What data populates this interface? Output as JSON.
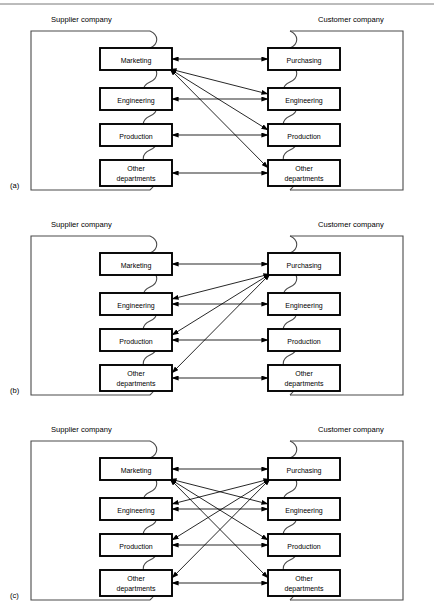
{
  "figure": {
    "top_rule": true,
    "background_color": "#ffffff",
    "box_border_color": "#000000",
    "frame_border_color": "#4a4a4a",
    "arrow_color": "#000000"
  },
  "headers": {
    "supplier": "Supplier company",
    "customer": "Customer company"
  },
  "supplier_departments": [
    {
      "label": "Marketing",
      "lines": [
        "Marketing"
      ]
    },
    {
      "label": "Engineering",
      "lines": [
        "Engineering"
      ]
    },
    {
      "label": "Production",
      "lines": [
        "Production"
      ]
    },
    {
      "label": "Other departments",
      "lines": [
        "Other",
        "departments"
      ]
    }
  ],
  "customer_departments": [
    {
      "label": "Purchasing",
      "lines": [
        "Purchasing"
      ]
    },
    {
      "label": "Engineering",
      "lines": [
        "Engineering"
      ]
    },
    {
      "label": "Production",
      "lines": [
        "Production"
      ]
    },
    {
      "label": "Other departments",
      "lines": [
        "Other",
        "departments"
      ]
    }
  ],
  "panels": [
    {
      "id": "a",
      "label": "(a)",
      "description": "All customer departments communicate through supplier Marketing",
      "horizontal_links": [
        {
          "from": "Marketing",
          "to": "Purchasing",
          "double_headed": true
        },
        {
          "from": "Engineering",
          "to": "Engineering",
          "double_headed": true
        },
        {
          "from": "Production",
          "to": "Production",
          "double_headed": true
        },
        {
          "from": "Other departments",
          "to": "Other departments",
          "double_headed": true
        }
      ],
      "fan_links": [
        {
          "hub": "supplier.Marketing",
          "spoke": "customer.Engineering",
          "double_headed": true
        },
        {
          "hub": "supplier.Marketing",
          "spoke": "customer.Production",
          "double_headed": true
        },
        {
          "hub": "supplier.Marketing",
          "spoke": "customer.Other departments",
          "double_headed": true
        }
      ]
    },
    {
      "id": "b",
      "label": "(b)",
      "description": "All supplier departments communicate through customer Purchasing",
      "horizontal_links": [
        {
          "from": "Marketing",
          "to": "Purchasing",
          "double_headed": true
        },
        {
          "from": "Engineering",
          "to": "Engineering",
          "double_headed": true
        },
        {
          "from": "Production",
          "to": "Production",
          "double_headed": true
        },
        {
          "from": "Other departments",
          "to": "Other departments",
          "double_headed": true
        }
      ],
      "fan_links": [
        {
          "hub": "customer.Purchasing",
          "spoke": "supplier.Engineering",
          "double_headed": true
        },
        {
          "hub": "customer.Purchasing",
          "spoke": "supplier.Production",
          "double_headed": true
        },
        {
          "hub": "customer.Purchasing",
          "spoke": "supplier.Other departments",
          "double_headed": true
        }
      ]
    },
    {
      "id": "c",
      "label": "(c)",
      "description": "Both hubs active: Marketing and Purchasing each fan out to all counterpart departments",
      "horizontal_links": [
        {
          "from": "Marketing",
          "to": "Purchasing",
          "double_headed": true
        },
        {
          "from": "Engineering",
          "to": "Engineering",
          "double_headed": true
        },
        {
          "from": "Production",
          "to": "Production",
          "double_headed": true
        },
        {
          "from": "Other departments",
          "to": "Other departments",
          "double_headed": true
        }
      ],
      "fan_links": [
        {
          "hub": "supplier.Marketing",
          "spoke": "customer.Engineering",
          "double_headed": true
        },
        {
          "hub": "supplier.Marketing",
          "spoke": "customer.Production",
          "double_headed": true
        },
        {
          "hub": "supplier.Marketing",
          "spoke": "customer.Other departments",
          "double_headed": true
        },
        {
          "hub": "customer.Purchasing",
          "spoke": "supplier.Engineering",
          "double_headed": true
        },
        {
          "hub": "customer.Purchasing",
          "spoke": "supplier.Production",
          "double_headed": true
        },
        {
          "hub": "customer.Purchasing",
          "spoke": "supplier.Other departments",
          "double_headed": true
        }
      ]
    }
  ]
}
